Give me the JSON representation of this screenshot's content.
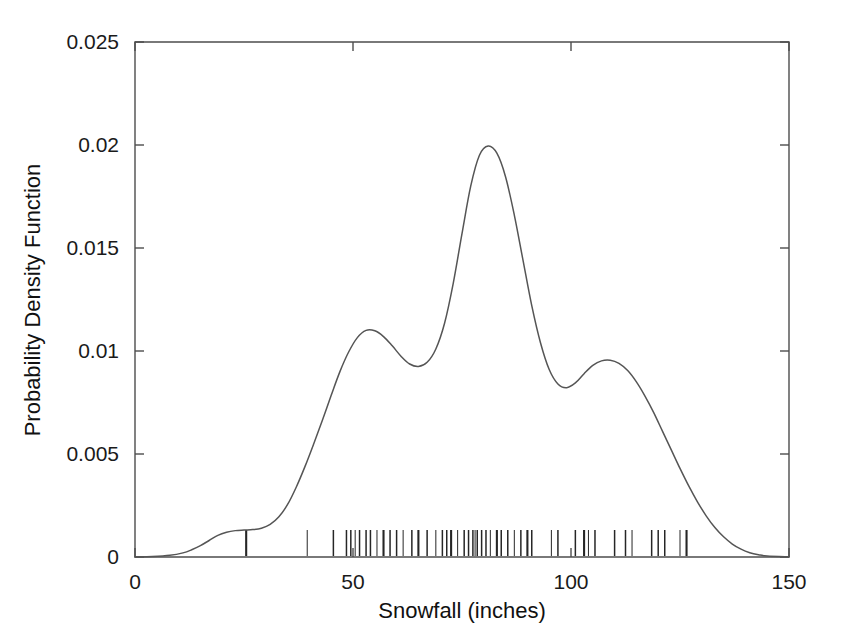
{
  "chart_data": {
    "type": "line",
    "title": "",
    "subtitle": "",
    "xlabel": "Snowfall (inches)",
    "ylabel": "Probability Density Function",
    "xlim": [
      0,
      150
    ],
    "ylim": [
      0,
      0.025
    ],
    "grid": false,
    "legend": false,
    "legend_position": "none",
    "xticks": [
      0,
      50,
      100,
      150
    ],
    "xtick_labels": [
      "0",
      "50",
      "100",
      "150"
    ],
    "yticks": [
      0,
      0.005,
      0.01,
      0.015,
      0.02,
      0.025
    ],
    "ytick_labels": [
      "0",
      "0.005",
      "0.01",
      "0.015",
      "0.02",
      "0.025"
    ],
    "annotations": [],
    "series": [
      {
        "name": "Kernel density estimate",
        "type": "line",
        "color": "#555555",
        "x": [
          0,
          4,
          8,
          11,
          13,
          15,
          17,
          19,
          21,
          23,
          25,
          27,
          29,
          31,
          33,
          35,
          37,
          39,
          41,
          43,
          45,
          47,
          49,
          51,
          53,
          55,
          57,
          59,
          61,
          63,
          65,
          67,
          69,
          71,
          73,
          75,
          77,
          79,
          81,
          83,
          85,
          87,
          89,
          91,
          93,
          95,
          97,
          99,
          101,
          103,
          105,
          107,
          109,
          111,
          113,
          115,
          117,
          119,
          121,
          123,
          125,
          127,
          129,
          131,
          133,
          135,
          137,
          139,
          141,
          143,
          145,
          150
        ],
        "y": [
          0,
          2e-05,
          8e-05,
          0.0002,
          0.00035,
          0.00055,
          0.0008,
          0.00105,
          0.0012,
          0.00128,
          0.00131,
          0.00133,
          0.0014,
          0.00158,
          0.00195,
          0.00255,
          0.0034,
          0.0044,
          0.0055,
          0.00665,
          0.00785,
          0.009,
          0.00995,
          0.01065,
          0.011,
          0.01098,
          0.0107,
          0.01025,
          0.00975,
          0.00937,
          0.00925,
          0.00945,
          0.0101,
          0.01135,
          0.0133,
          0.0157,
          0.018,
          0.0195,
          0.01995,
          0.0196,
          0.01845,
          0.0166,
          0.0144,
          0.0122,
          0.0104,
          0.0091,
          0.0084,
          0.00822,
          0.00845,
          0.0089,
          0.0093,
          0.00952,
          0.00955,
          0.0094,
          0.00905,
          0.0085,
          0.0078,
          0.007,
          0.0061,
          0.0052,
          0.0043,
          0.00345,
          0.00268,
          0.002,
          0.00143,
          0.00098,
          0.00063,
          0.00038,
          0.00021,
          0.00011,
          5e-05,
          1e-05
        ],
        "peaks": [
          {
            "x": 25.5,
            "y": 0.00131,
            "label": "left shoulder bump"
          },
          {
            "x": 53.5,
            "y": 0.011,
            "label": "secondary mode"
          },
          {
            "x": 81,
            "y": 0.01995,
            "label": "primary mode"
          },
          {
            "x": 108,
            "y": 0.00955,
            "label": "tertiary mode"
          }
        ],
        "valleys": [
          {
            "x": 64.5,
            "y": 0.00923
          },
          {
            "x": 98.5,
            "y": 0.0082
          }
        ]
      },
      {
        "name": "Data rug marks",
        "type": "rug",
        "color": "#262626",
        "x": [
          25.5,
          39.5,
          45.5,
          48.5,
          49.5,
          50.5,
          51.5,
          53.0,
          54.0,
          55.5,
          57.0,
          58.5,
          60.0,
          61.5,
          63.5,
          65.0,
          67.0,
          69.0,
          70.5,
          71.5,
          72.5,
          74.0,
          75.5,
          76.5,
          77.5,
          78.0,
          78.5,
          79.5,
          80.5,
          81.5,
          83.0,
          84.0,
          85.5,
          87.0,
          88.5,
          90.0,
          91.0,
          95.5,
          97.0,
          101.0,
          103.0,
          104.0,
          105.5,
          110.0,
          112.5,
          114.0,
          118.5,
          120.0,
          121.5,
          125.0,
          126.5
        ],
        "count": 51
      }
    ]
  },
  "axis": {
    "x_title": "Snowfall (inches)",
    "y_title": "Probability Density Function",
    "x_tick_labels": [
      "0",
      "50",
      "100",
      "150"
    ],
    "y_tick_labels": [
      "0",
      "0.005",
      "0.01",
      "0.015",
      "0.02",
      "0.025"
    ]
  },
  "colors": {
    "curve": "#555555",
    "rug": "#262626",
    "axis": "#4d4d4d",
    "background": "#ffffff",
    "text": "#1a1a1a"
  }
}
